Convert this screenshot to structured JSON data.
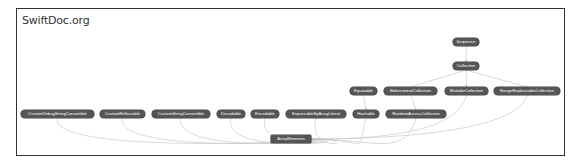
{
  "title": "SwiftDoc.org",
  "colors": {
    "node_fill": "#555555",
    "node_text": "#ffffff",
    "edge": "#c8c8c8",
    "frame_border": "#333333"
  },
  "diagram": {
    "type": "inheritance-graph",
    "nodes": [
      {
        "id": "Sequence",
        "label": "Sequence",
        "x": 453,
        "y": 38,
        "w": 26
      },
      {
        "id": "Collection",
        "label": "Collection",
        "x": 453,
        "y": 62,
        "w": 26
      },
      {
        "id": "Equatable",
        "label": "Equatable",
        "x": 350,
        "y": 87,
        "w": 27
      },
      {
        "id": "BidirectionalCollection",
        "label": "BidirectionalCollection",
        "x": 384,
        "y": 87,
        "w": 53
      },
      {
        "id": "MutableCollection",
        "label": "MutableCollection",
        "x": 445,
        "y": 87,
        "w": 43
      },
      {
        "id": "RangeReplaceableCollection",
        "label": "RangeReplaceableCollection",
        "x": 494,
        "y": 87,
        "w": 66
      },
      {
        "id": "CustomDebugStringConvertible",
        "label": "CustomDebugStringConvertible",
        "x": 21,
        "y": 110,
        "w": 73
      },
      {
        "id": "CustomReflectable",
        "label": "CustomReflectable",
        "x": 100,
        "y": 110,
        "w": 45
      },
      {
        "id": "CustomStringConvertible",
        "label": "CustomStringConvertible",
        "x": 152,
        "y": 110,
        "w": 58
      },
      {
        "id": "Decodable",
        "label": "Decodable",
        "x": 217,
        "y": 110,
        "w": 28
      },
      {
        "id": "Encodable",
        "label": "Encodable",
        "x": 251,
        "y": 110,
        "w": 28
      },
      {
        "id": "ExpressibleByArrayLiteral",
        "label": "ExpressibleByArrayLiteral",
        "x": 286,
        "y": 110,
        "w": 60
      },
      {
        "id": "Hashable",
        "label": "Hashable",
        "x": 353,
        "y": 110,
        "w": 26
      },
      {
        "id": "RandomAccessCollection",
        "label": "RandomAccessCollection",
        "x": 386,
        "y": 110,
        "w": 60
      },
      {
        "id": "ArrayElements",
        "label": "ArrayElements",
        "x": 271,
        "y": 135,
        "w": 40,
        "shape": "square"
      }
    ],
    "edges": [
      {
        "from": "Sequence",
        "to": "Collection"
      },
      {
        "from": "Collection",
        "to": "BidirectionalCollection"
      },
      {
        "from": "Collection",
        "to": "MutableCollection"
      },
      {
        "from": "Collection",
        "to": "RangeReplaceableCollection"
      },
      {
        "from": "Equatable",
        "to": "Hashable"
      },
      {
        "from": "BidirectionalCollection",
        "to": "RandomAccessCollection"
      },
      {
        "from": "CustomDebugStringConvertible",
        "to": "ArrayElements"
      },
      {
        "from": "CustomReflectable",
        "to": "ArrayElements"
      },
      {
        "from": "CustomStringConvertible",
        "to": "ArrayElements"
      },
      {
        "from": "Decodable",
        "to": "ArrayElements"
      },
      {
        "from": "Encodable",
        "to": "ArrayElements"
      },
      {
        "from": "ExpressibleByArrayLiteral",
        "to": "ArrayElements"
      },
      {
        "from": "Hashable",
        "to": "ArrayElements"
      },
      {
        "from": "RandomAccessCollection",
        "to": "ArrayElements"
      },
      {
        "from": "MutableCollection",
        "to": "ArrayElements"
      },
      {
        "from": "RangeReplaceableCollection",
        "to": "ArrayElements"
      }
    ]
  }
}
